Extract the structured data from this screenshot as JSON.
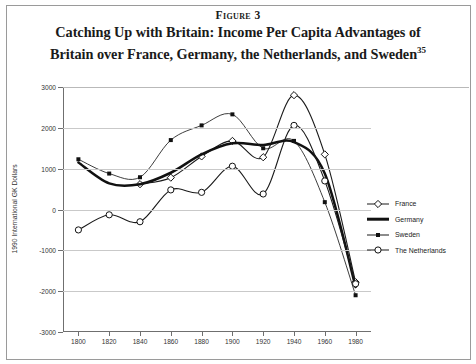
{
  "figure": {
    "label": "Figure 3",
    "title_line1": "Catching Up with Britain: Income Per Capita Advantages of",
    "title_line2": "Britain over France, Germany, the Netherlands, and Sweden",
    "footnote_marker": "35"
  },
  "legend": {
    "position": "right",
    "items": [
      {
        "label": "France",
        "marker": "open-diamond",
        "color": "#1a1a1a"
      },
      {
        "label": "Germany",
        "marker": "none",
        "color": "#111111"
      },
      {
        "label": "Sweden",
        "marker": "filled-square",
        "color": "#1a1a1a"
      },
      {
        "label": "The Netherlands",
        "marker": "open-circle",
        "color": "#1a1a1a"
      }
    ]
  },
  "chart_data": {
    "type": "line",
    "title": "Catching Up with Britain: Income Per Capita Advantages of Britain over France, Germany, the Netherlands, and Sweden",
    "xlabel": "",
    "ylabel": "1990 International GK Dollars",
    "x": [
      1800,
      1820,
      1840,
      1860,
      1880,
      1900,
      1920,
      1940,
      1960,
      1980
    ],
    "xlim": [
      1790,
      1990
    ],
    "ylim": [
      -3000,
      3000
    ],
    "xticks": [
      1800,
      1820,
      1840,
      1860,
      1880,
      1900,
      1920,
      1940,
      1960,
      1980
    ],
    "yticks": [
      3000,
      2000,
      1000,
      0,
      -1000,
      -2000,
      -3000
    ],
    "xtick_labels": [
      "1800",
      "1820",
      "1840",
      "1860",
      "1880",
      "1900",
      "1920",
      "1940",
      "1960",
      "1980"
    ],
    "ytick_labels": [
      "3000",
      "2000",
      "1000",
      "0",
      "-1000",
      "-2000",
      "-3000"
    ],
    "grid": true,
    "grid_axis": "y",
    "series": [
      {
        "name": "France",
        "marker": "open-diamond",
        "values": [
          null,
          null,
          620,
          780,
          1300,
          1680,
          1280,
          2800,
          1350,
          -1780
        ]
      },
      {
        "name": "Germany",
        "marker": "none",
        "values": [
          1150,
          640,
          620,
          900,
          1350,
          1620,
          1580,
          1650,
          880,
          -1900
        ]
      },
      {
        "name": "Sweden",
        "marker": "filled-square",
        "values": [
          1230,
          880,
          790,
          1700,
          2060,
          2330,
          1500,
          1680,
          180,
          -2100
        ]
      },
      {
        "name": "The Netherlands",
        "marker": "open-circle",
        "values": [
          -500,
          -130,
          -300,
          480,
          420,
          1060,
          380,
          2060,
          700,
          -1820
        ]
      }
    ]
  }
}
